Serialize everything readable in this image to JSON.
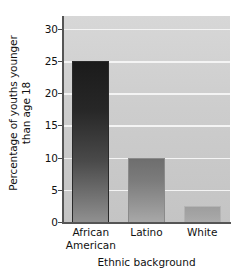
{
  "chart_data": {
    "type": "bar",
    "title": "",
    "categories": [
      "African American",
      "Latino",
      "White"
    ],
    "category_lines": [
      [
        "African",
        "American"
      ],
      [
        "Latino"
      ],
      [
        "White"
      ]
    ],
    "values": [
      25,
      10,
      2.5
    ],
    "xlabel": "Ethnic background",
    "ylabel": "Percentage of youths younger than age 18",
    "ylabel_lines": [
      "Percentage of youths younger",
      "than age 18"
    ],
    "ylim": [
      0,
      32
    ],
    "yticks": [
      0,
      5,
      10,
      15,
      20,
      25,
      30
    ],
    "ytick_labels": [
      "0",
      "5",
      "10",
      "15",
      "20",
      "25",
      "30"
    ],
    "grid": true,
    "grid_axis": "y",
    "legend": null,
    "legend_position": "none",
    "bar_colors": [
      "#1b1b1b",
      "#7c7c7c",
      "#a5a5a5"
    ],
    "plot_background": "#cfcfcf",
    "grid_color": "#f4f4f4",
    "axis_color": "#555555",
    "text_color": "#111111"
  }
}
